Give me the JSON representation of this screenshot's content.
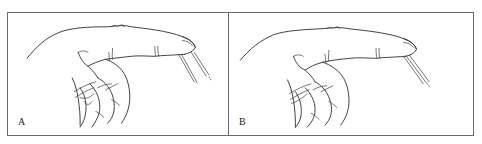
{
  "figure": {
    "panels": [
      {
        "id": "A",
        "label": "A",
        "illustration": "hand-with-extended-index-finger-and-needles"
      },
      {
        "id": "B",
        "label": "B",
        "illustration": "hand-with-extended-index-finger-and-needles"
      }
    ]
  },
  "colors": {
    "ink": "#2a2a2a",
    "border": "#6a6a6a",
    "background": "#ffffff"
  }
}
